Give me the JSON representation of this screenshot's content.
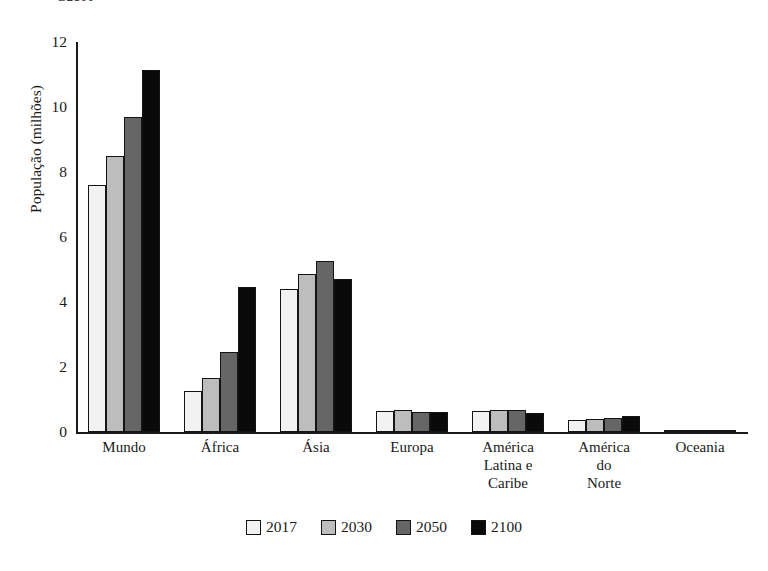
{
  "top_caption": "G2100",
  "chart_data": {
    "type": "bar",
    "title": "",
    "xlabel": "",
    "ylabel": "População (milhões)",
    "ylim": [
      0,
      12
    ],
    "yticks": [
      0,
      2,
      4,
      6,
      8,
      10,
      12
    ],
    "grid": false,
    "legend_position": "bottom",
    "categories": [
      "Mundo",
      "África",
      "Ásia",
      "Europa",
      "América\nLatina e\nCaribe",
      "América\ndo Norte",
      "Oceania"
    ],
    "series": [
      {
        "name": "2017",
        "color": "#f2f2f2",
        "values": [
          7.6,
          1.25,
          4.4,
          0.66,
          0.64,
          0.36,
          0.04
        ]
      },
      {
        "name": "2030",
        "color": "#bdbdbd",
        "values": [
          8.5,
          1.65,
          4.85,
          0.67,
          0.67,
          0.4,
          0.05
        ]
      },
      {
        "name": "2050",
        "color": "#666666",
        "values": [
          9.7,
          2.45,
          5.25,
          0.63,
          0.68,
          0.43,
          0.06
        ]
      },
      {
        "name": "2100",
        "color": "#0a0a0a",
        "values": [
          11.15,
          4.45,
          4.7,
          0.61,
          0.6,
          0.5,
          0.07
        ]
      }
    ]
  }
}
